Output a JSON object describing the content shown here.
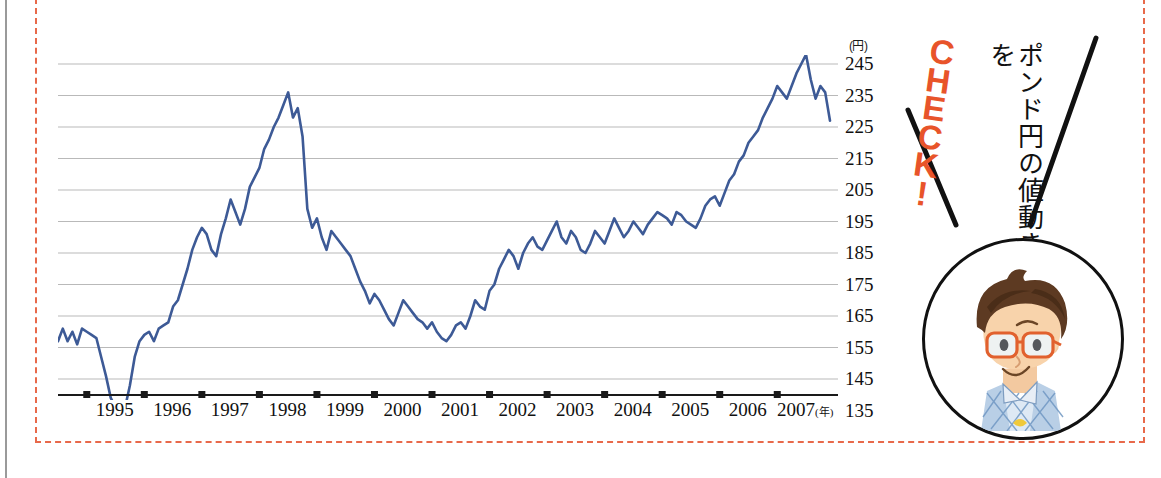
{
  "chart_data": {
    "type": "line",
    "title": "",
    "xlabel": "(年)",
    "ylabel": "(円)",
    "y_unit": "(円)",
    "x_unit": "(年)",
    "ylim": [
      130,
      250
    ],
    "grid": true,
    "legend": "none",
    "line_color": "#3d5a96",
    "y_ticks": [
      245,
      235,
      225,
      215,
      205,
      195,
      185,
      175,
      165,
      155,
      145,
      135
    ],
    "x_ticks": [
      "1995",
      "1996",
      "1997",
      "1998",
      "1999",
      "2000",
      "2001",
      "2002",
      "2003",
      "2004",
      "2005",
      "2006",
      "2007"
    ],
    "x_range": [
      "1994-07",
      "2007-12"
    ],
    "series": [
      {
        "name": "GBP/JPY",
        "x": [
          "1994-07",
          "1994-08",
          "1994-09",
          "1994-10",
          "1994-11",
          "1994-12",
          "1995-01",
          "1995-02",
          "1995-03",
          "1995-04",
          "1995-05",
          "1995-06",
          "1995-07",
          "1995-08",
          "1995-09",
          "1995-10",
          "1995-11",
          "1995-12",
          "1996-01",
          "1996-02",
          "1996-03",
          "1996-04",
          "1996-05",
          "1996-06",
          "1996-07",
          "1996-08",
          "1996-09",
          "1996-10",
          "1996-11",
          "1996-12",
          "1997-01",
          "1997-02",
          "1997-03",
          "1997-04",
          "1997-05",
          "1997-06",
          "1997-07",
          "1997-08",
          "1997-09",
          "1997-10",
          "1997-11",
          "1997-12",
          "1998-01",
          "1998-02",
          "1998-03",
          "1998-04",
          "1998-05",
          "1998-06",
          "1998-07",
          "1998-08",
          "1998-09",
          "1998-10",
          "1998-11",
          "1998-12",
          "1999-01",
          "1999-02",
          "1999-03",
          "1999-04",
          "1999-05",
          "1999-06",
          "1999-07",
          "1999-08",
          "1999-09",
          "1999-10",
          "1999-11",
          "1999-12",
          "2000-01",
          "2000-02",
          "2000-03",
          "2000-04",
          "2000-05",
          "2000-06",
          "2000-07",
          "2000-08",
          "2000-09",
          "2000-10",
          "2000-11",
          "2000-12",
          "2001-01",
          "2001-02",
          "2001-03",
          "2001-04",
          "2001-05",
          "2001-06",
          "2001-07",
          "2001-08",
          "2001-09",
          "2001-10",
          "2001-11",
          "2001-12",
          "2002-01",
          "2002-02",
          "2002-03",
          "2002-04",
          "2002-05",
          "2002-06",
          "2002-07",
          "2002-08",
          "2002-09",
          "2002-10",
          "2002-11",
          "2002-12",
          "2003-01",
          "2003-02",
          "2003-03",
          "2003-04",
          "2003-05",
          "2003-06",
          "2003-07",
          "2003-08",
          "2003-09",
          "2003-10",
          "2003-11",
          "2003-12",
          "2004-01",
          "2004-02",
          "2004-03",
          "2004-04",
          "2004-05",
          "2004-06",
          "2004-07",
          "2004-08",
          "2004-09",
          "2004-10",
          "2004-11",
          "2004-12",
          "2005-01",
          "2005-02",
          "2005-03",
          "2005-04",
          "2005-05",
          "2005-06",
          "2005-07",
          "2005-08",
          "2005-09",
          "2005-10",
          "2005-11",
          "2005-12",
          "2006-01",
          "2006-02",
          "2006-03",
          "2006-04",
          "2006-05",
          "2006-06",
          "2006-07",
          "2006-08",
          "2006-09",
          "2006-10",
          "2006-11",
          "2006-12",
          "2007-01",
          "2007-02",
          "2007-03",
          "2007-04",
          "2007-05",
          "2007-06",
          "2007-07",
          "2007-08",
          "2007-09",
          "2007-10",
          "2007-11",
          "2007-12"
        ],
        "values": [
          157,
          161,
          157,
          160,
          156,
          161,
          160,
          159,
          158,
          152,
          146,
          139,
          136,
          135,
          136,
          143,
          152,
          157,
          159,
          160,
          157,
          161,
          162,
          163,
          168,
          170,
          175,
          180,
          186,
          190,
          193,
          191,
          186,
          184,
          191,
          196,
          202,
          198,
          194,
          199,
          206,
          209,
          212,
          218,
          221,
          225,
          228,
          232,
          236,
          228,
          231,
          222,
          199,
          193,
          196,
          190,
          186,
          192,
          190,
          188,
          186,
          184,
          180,
          176,
          173,
          169,
          172,
          170,
          167,
          164,
          162,
          166,
          170,
          168,
          166,
          164,
          163,
          161,
          163,
          160,
          158,
          157,
          159,
          162,
          163,
          161,
          165,
          170,
          168,
          167,
          173,
          175,
          180,
          183,
          186,
          184,
          180,
          185,
          188,
          190,
          187,
          186,
          189,
          192,
          195,
          190,
          188,
          192,
          190,
          186,
          185,
          188,
          192,
          190,
          188,
          192,
          196,
          193,
          190,
          192,
          195,
          193,
          191,
          194,
          196,
          198,
          197,
          196,
          194,
          198,
          197,
          195,
          194,
          193,
          196,
          200,
          202,
          203,
          200,
          204,
          208,
          210,
          214,
          216,
          220,
          222,
          224,
          228,
          231,
          234,
          238,
          236,
          234,
          238,
          242,
          245,
          248,
          240,
          234,
          238,
          236,
          227
        ]
      }
    ]
  },
  "annotation": {
    "check_letters": [
      "C",
      "H",
      "E",
      "C",
      "K",
      "!"
    ],
    "check_text": "CHECK!",
    "vertical_text": "ポンド円の値動きを",
    "character_alt": "boy-with-glasses-illustration"
  }
}
